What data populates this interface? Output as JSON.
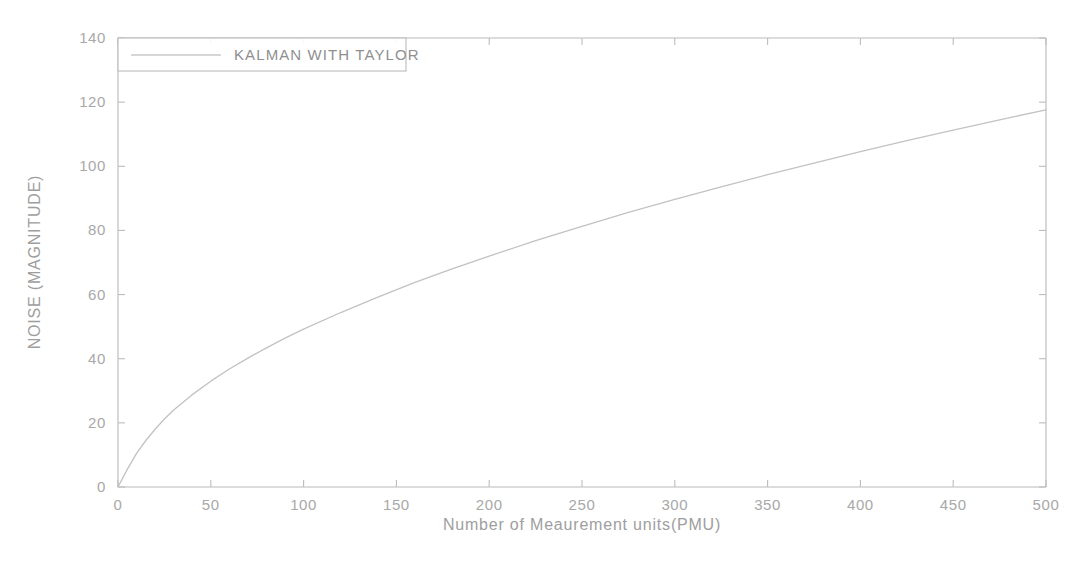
{
  "figure": {
    "background_color": "#ffffff",
    "plot_area": {
      "left": 118,
      "top": 38,
      "right": 1046,
      "bottom": 487
    }
  },
  "chart_data": {
    "type": "line",
    "title": "",
    "subtitle": "",
    "xlabel": "Number of Meaurement units(PMU)",
    "ylabel": "NOISE (MAGNITUDE)",
    "xlim": [
      0,
      500
    ],
    "ylim": [
      0,
      140
    ],
    "xticks": [
      0,
      50,
      100,
      150,
      200,
      250,
      300,
      350,
      400,
      450,
      500
    ],
    "xtick_labels": [
      "0",
      "50",
      "100",
      "150",
      "200",
      "250",
      "300",
      "350",
      "400",
      "450",
      "500"
    ],
    "yticks": [
      0,
      20,
      40,
      60,
      80,
      100,
      120,
      140
    ],
    "ytick_labels": [
      "0",
      "20",
      "40",
      "60",
      "80",
      "100",
      "120",
      "140"
    ],
    "grid": false,
    "legend_position": "upper-left",
    "legend_entries": [
      "KALMAN WITH TAYLOR"
    ],
    "line_color": "#c2c2c2",
    "series": [
      {
        "name": "KALMAN WITH TAYLOR",
        "color": "#c2c2c2",
        "x": [
          0,
          5,
          10,
          15,
          20,
          25,
          30,
          40,
          50,
          60,
          70,
          80,
          90,
          100,
          120,
          140,
          160,
          180,
          200,
          225,
          250,
          275,
          300,
          325,
          350,
          375,
          400,
          425,
          450,
          475,
          500
        ],
        "values": [
          0,
          5.5,
          10.5,
          14.5,
          18.0,
          21.2,
          24.0,
          28.8,
          33.0,
          36.8,
          40.2,
          43.4,
          46.4,
          49.2,
          54.4,
          59.2,
          63.8,
          68.0,
          72.0,
          76.8,
          81.3,
          85.6,
          89.7,
          93.6,
          97.4,
          101.0,
          104.6,
          108.0,
          111.3,
          114.5,
          117.6
        ],
        "note": "concave increasing curve from origin to (500, 140)"
      }
    ],
    "curve_endpoints": {
      "start": [
        0,
        0
      ],
      "end": [
        500,
        140
      ]
    }
  }
}
